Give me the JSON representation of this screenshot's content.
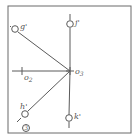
{
  "diagram": {
    "type": "mechanical-linkage-sketch",
    "figure_number": "3",
    "colors": {
      "line": "#5a5a5a",
      "frame": "#6a6a6a",
      "background": "#ffffff"
    },
    "center": {
      "label": "o",
      "subscript": "3"
    },
    "secondary_point": {
      "label": "o",
      "subscript": "2"
    },
    "nodes": [
      {
        "id": "g",
        "label": "g'"
      },
      {
        "id": "j",
        "label": "j'"
      },
      {
        "id": "h",
        "label": "h'"
      },
      {
        "id": "k",
        "label": "k'"
      }
    ]
  }
}
